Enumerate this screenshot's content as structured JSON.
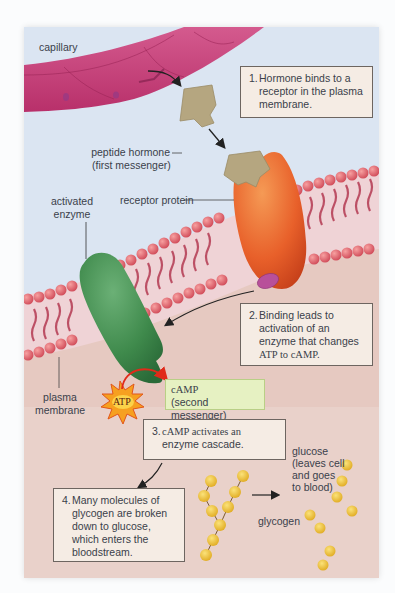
{
  "figure": {
    "labels": {
      "capillary": "capillary",
      "peptide_hormone_line1": "peptide hormone",
      "peptide_hormone_line2": "(first messenger)",
      "activated_enzyme_line1": "activated",
      "activated_enzyme_line2": "enzyme",
      "receptor_protein": "receptor protein",
      "plasma_membrane_line1": "plasma",
      "plasma_membrane_line2": "membrane",
      "atp": "ATP",
      "camp_line1": "cAMP",
      "camp_line2": "(second messenger)",
      "glucose_line1": "glucose",
      "glucose_line2": "(leaves cell",
      "glucose_line3": "and goes",
      "glucose_line4": "to blood)",
      "glycogen": "glycogen"
    },
    "steps": [
      {
        "number": "1.",
        "lines": [
          "Hormone binds to a",
          "receptor in the plasma",
          "membrane."
        ]
      },
      {
        "number": "2.",
        "lines": [
          "Binding leads to",
          "activation of an",
          "enzyme that changes",
          "ATP to cAMP."
        ]
      },
      {
        "number": "3.",
        "lines": [
          "cAMP activates an",
          "enzyme cascade."
        ]
      },
      {
        "number": "4.",
        "lines": [
          "Many molecules of",
          "glycogen are broken",
          "down to glucose,",
          "which enters the",
          "bloodstream."
        ]
      }
    ],
    "colors": {
      "extracellular_bg": "#dce6f3",
      "cytoplasm_bg": "#e8c9c0",
      "capillary": "#c43d78",
      "hormone": "#b5a680",
      "receptor": "#e8602a",
      "enzyme": "#3f8a4c",
      "membrane_head": "#e0606a",
      "membrane_tail": "#b43a52",
      "g_protein": "#b8509a",
      "atp_burst": "#f6a020",
      "camp_box": "#e6f1c2",
      "step_box": "#f5ece4",
      "glucose": "#f0c238"
    }
  }
}
